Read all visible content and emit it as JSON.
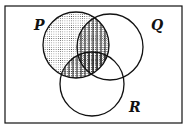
{
  "diagram": {
    "type": "venn",
    "sets": [
      {
        "id": "P",
        "label": "P",
        "cx": 76,
        "cy": 45,
        "r": 33,
        "label_x": 34,
        "label_y": 30
      },
      {
        "id": "Q",
        "label": "Q",
        "cx": 110,
        "cy": 47,
        "r": 33,
        "label_x": 151,
        "label_y": 30
      },
      {
        "id": "R",
        "label": "R",
        "cx": 92,
        "cy": 84,
        "r": 32,
        "label_x": 129,
        "label_y": 112
      }
    ],
    "frame": {
      "x": 5,
      "y": 6,
      "width": 177,
      "height": 117
    },
    "shading": [
      {
        "region": "P",
        "pattern": "dots"
      },
      {
        "region": "P ∩ (Q ∪ R)",
        "pattern": "vertical-stripes"
      }
    ],
    "colors": {
      "stroke": "#111111",
      "background": "#ffffff",
      "pattern": "#333333"
    }
  }
}
